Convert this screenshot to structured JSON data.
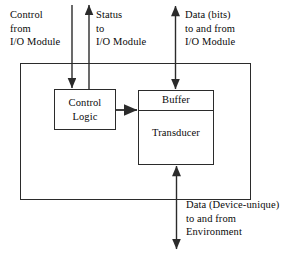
{
  "diagram": {
    "outer_box": {
      "label": "external-device-boundary"
    },
    "boxes": [
      {
        "id": "control-logic",
        "label": "Control\nLogic"
      },
      {
        "id": "buffer",
        "label": "Buffer"
      },
      {
        "id": "transducer",
        "label": "Transducer"
      }
    ],
    "labels": {
      "control_from": "Control\nfrom\nI/O Module",
      "status_to": "Status\nto\nI/O Module",
      "data_bits": "Data (bits)\nto and from\nI/O Module",
      "data_device_unique": "Data (Device-unique)\nto and from\nEnvironment"
    },
    "arrows": [
      {
        "id": "control-arrow",
        "direction": "down",
        "target": "control-logic"
      },
      {
        "id": "status-arrow",
        "direction": "up",
        "source": "control-logic"
      },
      {
        "id": "data-bits-arrow",
        "direction": "both",
        "target": "buffer"
      },
      {
        "id": "control-to-buffer-arrow",
        "direction": "right",
        "source": "control-logic",
        "target": "buffer"
      },
      {
        "id": "environment-arrow",
        "direction": "both",
        "target": "transducer"
      }
    ],
    "colors": {
      "stroke": "#2b2b2b",
      "text": "#0a0a0a",
      "background": "#ffffff"
    }
  }
}
